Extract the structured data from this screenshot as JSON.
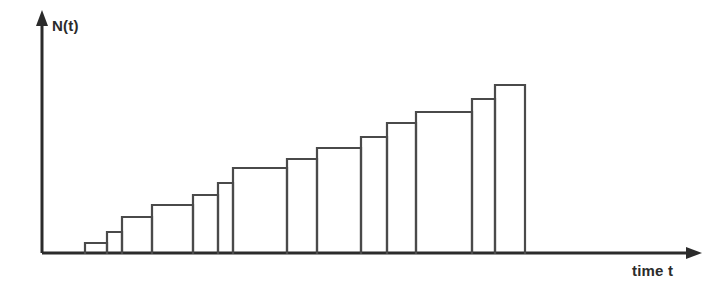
{
  "chart_data": {
    "type": "line",
    "title": "",
    "subtitle": "",
    "xlabel": "time t",
    "ylabel": "N(t)",
    "style": "step-function staircase, monotonically increasing counting process",
    "grid": false,
    "legend": null,
    "tick_labels": {
      "x": [],
      "y": []
    },
    "axis_arrows": {
      "x": true,
      "y": true
    },
    "xlim": [
      0,
      14
    ],
    "ylim": [
      0,
      14
    ],
    "series": [
      {
        "name": "N(t)",
        "kind": "step-post",
        "x_breaks": [
          1.45,
          2.45,
          3.15,
          4.0,
          5.2,
          6.85,
          7.55,
          9.6,
          11.0,
          12.1,
          13.25,
          14.6,
          16.3,
          17.35,
          18.7
        ],
        "values": [
          1,
          2,
          3,
          4,
          5,
          6,
          7,
          8,
          9,
          10,
          11,
          12,
          13,
          14
        ]
      }
    ],
    "steps": [
      {
        "index": 1,
        "x_start": 85,
        "x_end": 107,
        "top": 243,
        "value": 1
      },
      {
        "index": 2,
        "x_start": 107,
        "x_end": 122,
        "top": 232,
        "value": 2
      },
      {
        "index": 3,
        "x_start": 122,
        "x_end": 152,
        "top": 217,
        "value": 3
      },
      {
        "index": 4,
        "x_start": 152,
        "x_end": 193,
        "top": 205,
        "value": 4
      },
      {
        "index": 5,
        "x_start": 193,
        "x_end": 218,
        "top": 195,
        "value": 5
      },
      {
        "index": 6,
        "x_start": 218,
        "x_end": 233,
        "top": 183,
        "value": 6
      },
      {
        "index": 7,
        "x_start": 233,
        "x_end": 287,
        "top": 168,
        "value": 7
      },
      {
        "index": 8,
        "x_start": 287,
        "x_end": 317,
        "top": 159,
        "value": 8
      },
      {
        "index": 9,
        "x_start": 317,
        "x_end": 361,
        "top": 148,
        "value": 9
      },
      {
        "index": 10,
        "x_start": 361,
        "x_end": 387,
        "top": 137,
        "value": 10
      },
      {
        "index": 11,
        "x_start": 387,
        "x_end": 416,
        "top": 123,
        "value": 11
      },
      {
        "index": 12,
        "x_start": 416,
        "x_end": 472,
        "top": 112,
        "value": 12
      },
      {
        "index": 13,
        "x_start": 472,
        "x_end": 495,
        "top": 99,
        "value": 13
      },
      {
        "index": 14,
        "x_start": 495,
        "x_end": 525,
        "top": 85,
        "value": 14
      }
    ],
    "colors": {
      "background": "#ffffff",
      "axis": "#2b2b2b",
      "step_line": "#4a4a4a",
      "label_text": "#2b2b2b"
    },
    "geometry": {
      "origin_x": 42,
      "baseline_y": 253,
      "y_axis_top": 12,
      "x_axis_end": 700
    }
  }
}
